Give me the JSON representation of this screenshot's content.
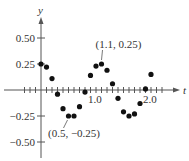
{
  "chart_data": {
    "type": "scatter",
    "title": "",
    "xlabel": "t",
    "ylabel": "y",
    "xlim": [
      -0.35,
      2.3
    ],
    "ylim": [
      -0.58,
      0.6
    ],
    "x_ticks": [
      {
        "value": 1.0,
        "label": "1.0"
      },
      {
        "value": 2.0,
        "label": "2.0"
      }
    ],
    "y_ticks": [
      {
        "value": 0.5,
        "label": "0.50"
      },
      {
        "value": 0.25,
        "label": "0.25"
      },
      {
        "value": -0.25,
        "label": "−0.25"
      },
      {
        "value": -0.5,
        "label": "−0.50"
      }
    ],
    "grid": false,
    "points": [
      {
        "x": 0.0,
        "y": 0.25
      },
      {
        "x": 0.1,
        "y": 0.22
      },
      {
        "x": 0.2,
        "y": 0.11
      },
      {
        "x": 0.3,
        "y": -0.04
      },
      {
        "x": 0.4,
        "y": -0.18
      },
      {
        "x": 0.5,
        "y": -0.25
      },
      {
        "x": 0.6,
        "y": -0.25
      },
      {
        "x": 0.7,
        "y": -0.16
      },
      {
        "x": 0.8,
        "y": -0.02
      },
      {
        "x": 0.9,
        "y": 0.14
      },
      {
        "x": 1.0,
        "y": 0.23
      },
      {
        "x": 1.1,
        "y": 0.25
      },
      {
        "x": 1.2,
        "y": 0.19
      },
      {
        "x": 1.3,
        "y": 0.06
      },
      {
        "x": 1.4,
        "y": -0.08
      },
      {
        "x": 1.5,
        "y": -0.21
      },
      {
        "x": 1.6,
        "y": -0.25
      },
      {
        "x": 1.7,
        "y": -0.23
      },
      {
        "x": 1.8,
        "y": -0.13
      },
      {
        "x": 1.9,
        "y": 0.01
      },
      {
        "x": 2.0,
        "y": 0.15
      }
    ],
    "annotations": [
      {
        "text": "(1.1, 0.25)",
        "x": 1.1,
        "y": 0.25
      },
      {
        "text": "(0.5, −0.25)",
        "x": 0.5,
        "y": -0.25
      }
    ]
  }
}
